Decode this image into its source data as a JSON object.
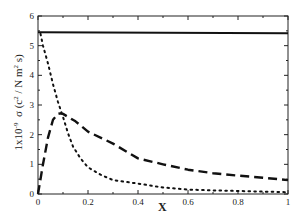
{
  "chart_data": {
    "type": "line",
    "title": "",
    "xlabel": "X",
    "ylabel": "1x10^-9 σ (c^2 / N m^2 s)",
    "ylabel_parts": {
      "prefix": "1x10",
      "exp": "-9",
      "sigma": "σ (c",
      "c_exp": "2",
      "mid": " / N m",
      "m_exp": "2",
      "suffix": " s)"
    },
    "xlim": [
      0,
      1
    ],
    "ylim": [
      0,
      6
    ],
    "xticks": [
      "0",
      "0.2",
      "0.4",
      "0.6",
      "0.8",
      "1"
    ],
    "yticks": [
      "0",
      "1",
      "2",
      "3",
      "4",
      "5",
      "6"
    ],
    "grid": false,
    "legend": null,
    "series": [
      {
        "name": "solid",
        "style": "solid",
        "x": [
          0,
          1
        ],
        "y": [
          5.45,
          5.42
        ]
      },
      {
        "name": "dashed",
        "style": "dashed",
        "x": [
          0,
          0.02,
          0.04,
          0.06,
          0.08,
          0.09,
          0.1,
          0.15,
          0.2,
          0.3,
          0.4,
          0.5,
          0.6,
          0.7,
          0.8,
          0.9,
          1.0
        ],
        "y": [
          0,
          1.0,
          1.9,
          2.5,
          2.7,
          2.72,
          2.7,
          2.45,
          2.1,
          1.7,
          1.2,
          1.0,
          0.82,
          0.7,
          0.62,
          0.55,
          0.47
        ]
      },
      {
        "name": "dotted",
        "style": "dotted",
        "x": [
          0.01,
          0.02,
          0.04,
          0.06,
          0.08,
          0.1,
          0.12,
          0.14,
          0.17,
          0.2,
          0.25,
          0.3,
          0.4,
          0.5,
          0.6,
          0.7,
          0.8,
          0.9,
          1.0
        ],
        "y": [
          5.4,
          5.0,
          4.4,
          3.7,
          3.1,
          2.6,
          2.05,
          1.6,
          1.2,
          0.9,
          0.65,
          0.47,
          0.35,
          0.22,
          0.15,
          0.12,
          0.1,
          0.08,
          0.06
        ]
      }
    ]
  }
}
